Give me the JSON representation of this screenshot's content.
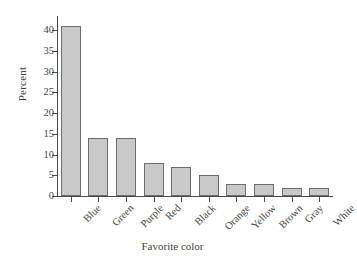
{
  "chart_data": {
    "type": "bar",
    "title": "",
    "xlabel": "Favorite color",
    "ylabel": "Percent",
    "categories": [
      "Blue",
      "Green",
      "Purple",
      "Red",
      "Black",
      "Orange",
      "Yellow",
      "Brown",
      "Gray",
      "White"
    ],
    "values": [
      41,
      14,
      14,
      8,
      7,
      5,
      3,
      3,
      2,
      2
    ],
    "ylim": [
      0,
      42
    ],
    "yticks": [
      0,
      5,
      10,
      15,
      20,
      25,
      30,
      35,
      40
    ],
    "ytick_labels": [
      "0",
      "5",
      "10",
      "15",
      "20",
      "25",
      "30",
      "35",
      "40"
    ],
    "grid": false,
    "legend": false,
    "bar_fill_color": "#c9c9c9",
    "bar_edge_color": "#6d6d6d",
    "axis_color": "#4a4a4a",
    "background_color": "#ffffff"
  }
}
